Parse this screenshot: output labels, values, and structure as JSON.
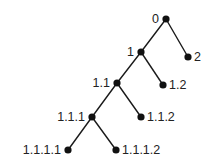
{
  "diagram": {
    "type": "tree",
    "root": "0",
    "colors": {
      "edge": "#1a1a1a",
      "node": "#111111",
      "label": "#222222",
      "background": "#ffffff"
    },
    "nodes": [
      {
        "id": "0",
        "label": "0",
        "x": 166,
        "y": 19,
        "label_side": "left"
      },
      {
        "id": "1",
        "label": "1",
        "x": 141,
        "y": 52,
        "label_side": "left"
      },
      {
        "id": "2",
        "label": "2",
        "x": 188,
        "y": 57,
        "label_side": "right"
      },
      {
        "id": "1.1",
        "label": "1.1",
        "x": 117,
        "y": 83,
        "label_side": "left"
      },
      {
        "id": "1.2",
        "label": "1.2",
        "x": 163,
        "y": 85,
        "label_side": "right"
      },
      {
        "id": "1.1.1",
        "label": "1.1.1",
        "x": 92,
        "y": 117,
        "label_side": "left"
      },
      {
        "id": "1.1.2",
        "label": "1.1.2",
        "x": 141,
        "y": 117,
        "label_side": "right"
      },
      {
        "id": "1.1.1.1",
        "label": "1.1.1.1",
        "x": 68,
        "y": 150,
        "label_side": "left"
      },
      {
        "id": "1.1.1.2",
        "label": "1.1.1.2",
        "x": 116,
        "y": 150,
        "label_side": "right"
      }
    ],
    "edges": [
      {
        "from": "0",
        "to": "1"
      },
      {
        "from": "0",
        "to": "2"
      },
      {
        "from": "1",
        "to": "1.1"
      },
      {
        "from": "1",
        "to": "1.2"
      },
      {
        "from": "1.1",
        "to": "1.1.1"
      },
      {
        "from": "1.1",
        "to": "1.1.2"
      },
      {
        "from": "1.1.1",
        "to": "1.1.1.1"
      },
      {
        "from": "1.1.1",
        "to": "1.1.1.2"
      }
    ]
  }
}
